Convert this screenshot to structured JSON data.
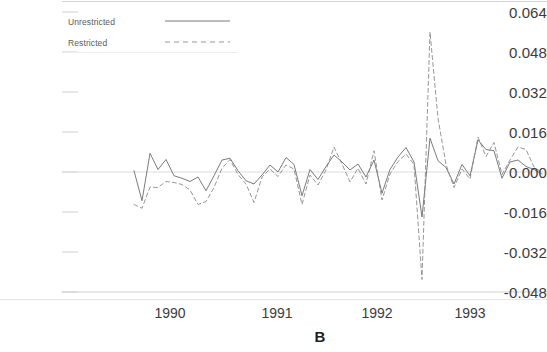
{
  "chart_data": {
    "type": "line",
    "title": "",
    "panel_label": "B",
    "xlabel": "",
    "ylabel": "",
    "grid": false,
    "ylim": [
      -0.048,
      0.064
    ],
    "xlim": [
      1989.62,
      1993.77
    ],
    "yticks": [
      "0.064",
      "0.048",
      "0.032",
      "0.016",
      "0.000",
      "-0.016",
      "-0.032",
      "-0.048"
    ],
    "ytick_values": [
      0.064,
      0.048,
      0.032,
      0.016,
      0.0,
      -0.016,
      -0.032,
      -0.048
    ],
    "xticks": [
      "1990",
      "1991",
      "1992",
      "1993"
    ],
    "xtick_values": [
      1990,
      1991,
      1992,
      1993
    ],
    "legend_position": "top-left",
    "zero_line": 0.0,
    "series": [
      {
        "name": "Unrestricted",
        "style": "solid",
        "color": "#6b6b6b",
        "x": [
          1989.64,
          1989.72,
          1989.8,
          1989.88,
          1989.96,
          1990.04,
          1990.12,
          1990.2,
          1990.28,
          1990.36,
          1990.44,
          1990.52,
          1990.6,
          1990.68,
          1990.76,
          1990.84,
          1990.92,
          1991.0,
          1991.08,
          1991.16,
          1991.24,
          1991.32,
          1991.4,
          1991.48,
          1991.56,
          1991.64,
          1991.72,
          1991.8,
          1991.88,
          1991.96,
          1992.04,
          1992.12,
          1992.2,
          1992.28,
          1992.36,
          1992.44,
          1992.52,
          1992.6,
          1992.68,
          1992.76,
          1992.84,
          1992.92,
          1993.0,
          1993.08,
          1993.16,
          1993.24,
          1993.32,
          1993.4,
          1993.48,
          1993.56,
          1993.64,
          1993.72
        ],
        "y": [
          0.0005,
          -0.0115,
          0.0075,
          0.001,
          0.005,
          -0.0015,
          -0.0025,
          -0.0038,
          -0.002,
          -0.0075,
          -0.0015,
          0.0048,
          0.0055,
          0.0005,
          -0.0035,
          -0.0048,
          -0.0012,
          0.0028,
          0.0,
          0.0058,
          0.003,
          -0.0095,
          0.001,
          -0.003,
          0.0022,
          0.0068,
          0.004,
          0.0008,
          0.0032,
          -0.002,
          0.0048,
          -0.0085,
          0.001,
          0.006,
          0.0098,
          0.004,
          -0.018,
          0.0135,
          0.0045,
          0.0018,
          -0.0048,
          0.003,
          -0.0015,
          0.0128,
          0.009,
          0.0085,
          -0.0025,
          0.004,
          0.0048,
          0.0022,
          0.001,
          -0.0008
        ]
      },
      {
        "name": "Restricted",
        "style": "dashed",
        "color": "#8a8a8a",
        "x": [
          1989.64,
          1989.72,
          1989.8,
          1989.88,
          1989.96,
          1990.04,
          1990.12,
          1990.2,
          1990.28,
          1990.36,
          1990.44,
          1990.52,
          1990.6,
          1990.68,
          1990.76,
          1990.84,
          1990.92,
          1991.0,
          1991.08,
          1991.16,
          1991.24,
          1991.32,
          1991.4,
          1991.48,
          1991.56,
          1991.64,
          1991.72,
          1991.8,
          1991.88,
          1991.96,
          1992.04,
          1992.12,
          1992.2,
          1992.28,
          1992.36,
          1992.44,
          1992.52,
          1992.6,
          1992.68,
          1992.76,
          1992.84,
          1992.92,
          1993.0,
          1993.08,
          1993.16,
          1993.24,
          1993.32,
          1993.4,
          1993.48,
          1993.56,
          1993.64,
          1993.72
        ],
        "y": [
          -0.013,
          -0.0145,
          -0.006,
          -0.0062,
          -0.0038,
          -0.0042,
          -0.005,
          -0.0072,
          -0.013,
          -0.0118,
          -0.0062,
          0.0015,
          0.005,
          -0.001,
          -0.0048,
          -0.0122,
          -0.002,
          0.0012,
          -0.0018,
          0.0028,
          0.0012,
          -0.013,
          -0.0012,
          -0.0052,
          0.0008,
          0.01,
          0.0032,
          -0.004,
          0.0015,
          -0.0048,
          0.0085,
          -0.0112,
          -0.0008,
          0.0042,
          0.0072,
          0.003,
          -0.043,
          0.056,
          0.0215,
          0.003,
          -0.0062,
          0.0012,
          -0.0028,
          0.014,
          0.0062,
          0.0118,
          -0.001,
          0.0048,
          0.01,
          0.009,
          0.002,
          -0.0002
        ]
      }
    ]
  },
  "legend": {
    "items": [
      {
        "label": "Unrestricted",
        "style": "solid"
      },
      {
        "label": "Restricted",
        "style": "dashed"
      }
    ]
  },
  "axis": {
    "ytick_0": "0.064",
    "ytick_1": "0.048",
    "ytick_2": "0.032",
    "ytick_3": "0.016",
    "ytick_4": "0.000",
    "ytick_5": "-0.016",
    "ytick_6": "-0.032",
    "ytick_7": "-0.048",
    "xtick_0": "1990",
    "xtick_1": "1991",
    "xtick_2": "1992",
    "xtick_3": "1993"
  },
  "panel": {
    "label": "B"
  },
  "colors": {
    "unrestricted": "#6b6b6b",
    "restricted": "#8a8a8a",
    "axis": "#c8c8c8",
    "text": "#3c3c3c"
  }
}
